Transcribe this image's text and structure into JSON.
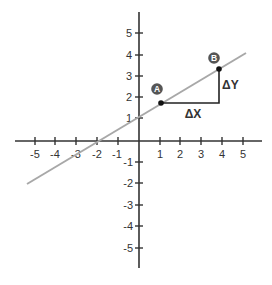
{
  "diagram": {
    "x_axis": {
      "ticks": [
        -5,
        -4,
        -3,
        -2,
        -1,
        1,
        2,
        3,
        4,
        5
      ],
      "tick_labels": [
        "-5",
        "-4",
        "-3",
        "-2",
        "-1",
        "1",
        "2",
        "3",
        "4",
        "5"
      ]
    },
    "y_axis": {
      "ticks": [
        5,
        4,
        3,
        2,
        1,
        -1,
        -2,
        -3,
        -4,
        -5
      ],
      "tick_labels": [
        "5",
        "4",
        "3",
        "2",
        "1",
        "-1",
        "-2",
        "-3",
        "-4",
        "-5"
      ]
    },
    "line": {
      "color": "#a8a8a8",
      "from": [
        -5.3,
        -2.1
      ],
      "to": [
        5.2,
        4.2
      ]
    },
    "points": {
      "A": {
        "label": "A",
        "x": 1.05,
        "y": 1.8
      },
      "B": {
        "label": "B",
        "x": 3.85,
        "y": 3.4
      }
    },
    "annotations": {
      "delta_x": "ΔX",
      "delta_y": "ΔY"
    },
    "colors": {
      "axis": "#333333",
      "line": "#a8a8a8",
      "point": "#111111",
      "label_circle": "#555555"
    }
  }
}
